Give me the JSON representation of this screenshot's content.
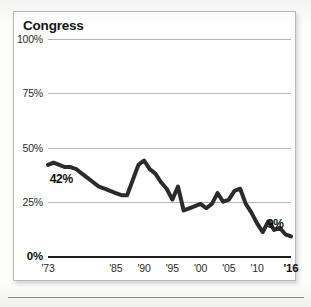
{
  "chart_data": {
    "type": "line",
    "title": "Congress",
    "xlabel": "",
    "ylabel": "",
    "grid": true,
    "legend": "none",
    "ylim": [
      0,
      100
    ],
    "xlim": [
      1973,
      2016
    ],
    "ytick_labels": [
      "100%",
      "75%",
      "50%",
      "25%",
      "0%"
    ],
    "ytick_values": [
      100,
      75,
      50,
      25,
      0
    ],
    "xtick_labels": [
      "'73",
      "'85",
      "'90",
      "'95",
      "'00",
      "'05",
      "'10",
      "'16"
    ],
    "xtick_values": [
      1973,
      1985,
      1990,
      1995,
      2000,
      2005,
      2010,
      2016
    ],
    "annotations": [
      {
        "text": "42%",
        "x": 1974,
        "y": 42
      },
      {
        "text": "9%",
        "x": 2016,
        "y": 9
      }
    ],
    "series": [
      {
        "name": "Congress",
        "color": "#2b2b2b",
        "x": [
          1973,
          1974,
          1975,
          1976,
          1977,
          1978,
          1979,
          1980,
          1981,
          1982,
          1983,
          1984,
          1985,
          1986,
          1987,
          1988,
          1989,
          1990,
          1991,
          1992,
          1993,
          1994,
          1995,
          1996,
          1997,
          1998,
          1999,
          2000,
          2001,
          2002,
          2003,
          2004,
          2005,
          2006,
          2007,
          2008,
          2009,
          2010,
          2011,
          2012,
          2013,
          2014,
          2015,
          2016
        ],
        "values": [
          42,
          43,
          42,
          41,
          41,
          40,
          38,
          36,
          34,
          32,
          31,
          30,
          29,
          28,
          28,
          35,
          42,
          44,
          40,
          38,
          34,
          31,
          26,
          32,
          21,
          22,
          23,
          24,
          22,
          24,
          29,
          25,
          26,
          30,
          31,
          24,
          20,
          15,
          11,
          16,
          12,
          13,
          10,
          9
        ]
      }
    ]
  }
}
